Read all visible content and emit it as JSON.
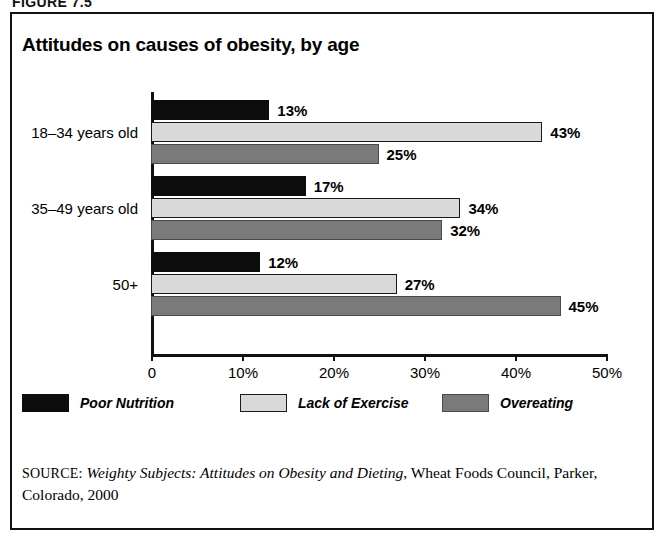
{
  "figure": {
    "caption": "FIGURE 7.5"
  },
  "chart": {
    "title": "Attitudes on causes of obesity, by age"
  },
  "source": {
    "label": "SOURCE:",
    "title_italic": "Weighty Subjects: Attitudes on Obesity and Dieting",
    "rest": ", Wheat Foods Council, Parker, Colorado, 2000"
  },
  "chart_data": {
    "type": "bar",
    "orientation": "horizontal",
    "title": "Attitudes on causes of obesity, by age",
    "xlabel": "",
    "ylabel": "",
    "xlim": [
      0,
      50
    ],
    "grid": false,
    "legend_position": "bottom",
    "categories": [
      "18–34 years old",
      "35–49 years old",
      "50+"
    ],
    "tick_labels": [
      "0",
      "10%",
      "20%",
      "30%",
      "40%",
      "50%"
    ],
    "tick_values": [
      0,
      10,
      20,
      30,
      40,
      50
    ],
    "series": [
      {
        "name": "Poor Nutrition",
        "color": "#0d0d0d",
        "values": [
          13,
          17,
          12
        ],
        "labels": [
          "13%",
          "17%",
          "12%"
        ]
      },
      {
        "name": "Lack of Exercise",
        "color": "#d9d9d9",
        "values": [
          43,
          34,
          27
        ],
        "labels": [
          "43%",
          "34%",
          "27%"
        ]
      },
      {
        "name": "Overeating",
        "color": "#7a7a7a",
        "values": [
          25,
          32,
          45
        ],
        "labels": [
          "25%",
          "32%",
          "45%"
        ]
      }
    ]
  }
}
